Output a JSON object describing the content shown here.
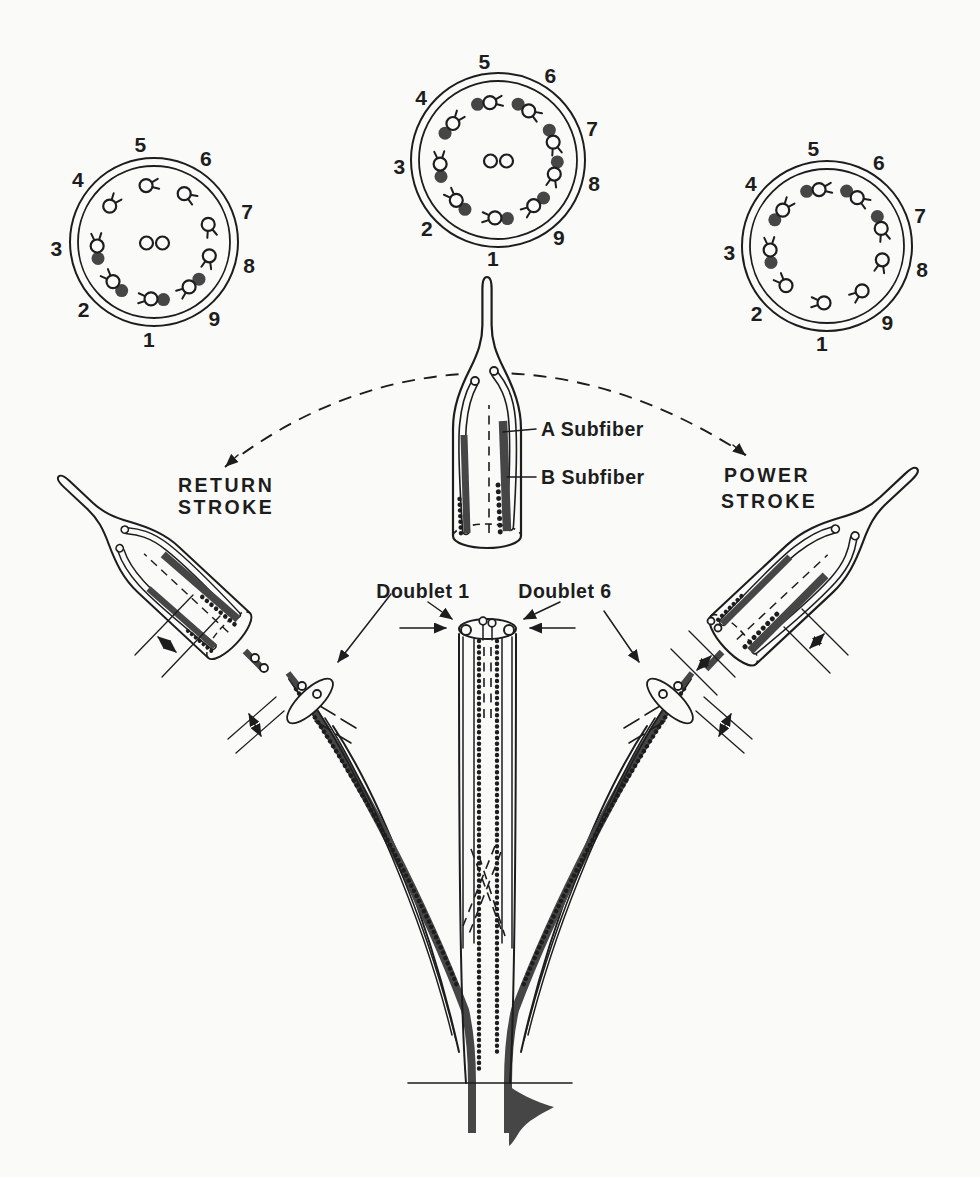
{
  "figure": {
    "labels": {
      "return_line1": "RETURN",
      "return_line2": "STROKE",
      "power_line1": "POWER",
      "power_line2": "STROKE",
      "a_subfiber": "A Subfiber",
      "b_subfiber": "B Subfiber",
      "doublet_1": "Doublet 1",
      "doublet_6": "Doublet 6"
    }
  },
  "colors": {
    "paper": "#fafaf9",
    "ink": "#1d1d1d",
    "subfiber": "#464646"
  },
  "cross_sections": [
    {
      "id": "return",
      "role": "return-stroke cross section",
      "cx": 154,
      "cy": 242,
      "r_outer": 84,
      "r_inner": 76,
      "ring_r": 57,
      "label_r": 98,
      "central_pair": true,
      "doublets": [
        {
          "n": "1",
          "angle": -93,
          "filled": true
        },
        {
          "n": "2",
          "angle": -136,
          "filled": true
        },
        {
          "n": "3",
          "angle": 184,
          "filled": true
        },
        {
          "n": "4",
          "angle": 141,
          "filled": false
        },
        {
          "n": "5",
          "angle": 98,
          "filled": false
        },
        {
          "n": "6",
          "angle": 58,
          "filled": false
        },
        {
          "n": "7",
          "angle": 18,
          "filled": false
        },
        {
          "n": "8",
          "angle": -14,
          "filled": false
        },
        {
          "n": "9",
          "angle": -52,
          "filled": true
        }
      ]
    },
    {
      "id": "middle",
      "role": "straight flagellum cross section",
      "cx": 498,
      "cy": 160,
      "r_outer": 87,
      "r_inner": 79,
      "ring_r": 58,
      "label_r": 99,
      "central_pair": true,
      "doublets": [
        {
          "n": "1",
          "angle": -93,
          "filled": true
        },
        {
          "n": "2",
          "angle": -136,
          "filled": true
        },
        {
          "n": "3",
          "angle": 184,
          "filled": true
        },
        {
          "n": "4",
          "angle": 141,
          "filled": true
        },
        {
          "n": "5",
          "angle": 98,
          "filled": true
        },
        {
          "n": "6",
          "angle": 58,
          "filled": true
        },
        {
          "n": "7",
          "angle": 18,
          "filled": true
        },
        {
          "n": "8",
          "angle": -14,
          "filled": true
        },
        {
          "n": "9",
          "angle": -52,
          "filled": true
        }
      ]
    },
    {
      "id": "power",
      "role": "power-stroke cross section",
      "cx": 827,
      "cy": 246,
      "r_outer": 85,
      "r_inner": 77,
      "ring_r": 57,
      "label_r": 98,
      "central_pair": false,
      "doublets": [
        {
          "n": "1",
          "angle": -93,
          "filled": false
        },
        {
          "n": "2",
          "angle": -136,
          "filled": false
        },
        {
          "n": "3",
          "angle": 184,
          "filled": true
        },
        {
          "n": "4",
          "angle": 141,
          "filled": true
        },
        {
          "n": "5",
          "angle": 98,
          "filled": true
        },
        {
          "n": "6",
          "angle": 58,
          "filled": true
        },
        {
          "n": "7",
          "angle": 18,
          "filled": true
        },
        {
          "n": "8",
          "angle": -14,
          "filled": false
        },
        {
          "n": "9",
          "angle": -52,
          "filled": false
        }
      ]
    }
  ]
}
